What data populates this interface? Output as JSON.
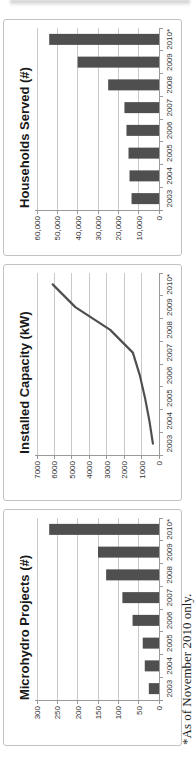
{
  "figure": {
    "footnote": "*As of November 2010 only.",
    "orientation_note": "landscape figure rotated 90 degrees counter-clockwise on page"
  },
  "colors": {
    "bar": "#4f4f4f",
    "line": "#4f4f4f",
    "grid": "#c9c9c9",
    "axis": "#9a9a9a",
    "tick_text": "#333333",
    "title_text": "#191919",
    "panel_border": "#c2c2c2",
    "background": "#ffffff"
  },
  "chart_data": [
    {
      "type": "bar",
      "title": "Microhydro Projects (#)",
      "categories": [
        "2003",
        "2004",
        "2005",
        "2006",
        "2007",
        "2008",
        "2009",
        "2010*"
      ],
      "values": [
        25,
        35,
        40,
        65,
        90,
        130,
        150,
        270
      ],
      "ylim": [
        0,
        300
      ],
      "ytick_step": 50,
      "yticks": [
        "0",
        "50",
        "100",
        "150",
        "200",
        "250",
        "300"
      ],
      "xlabel": "",
      "ylabel": "",
      "grid": true,
      "legend": "none"
    },
    {
      "type": "line",
      "title": "Installed Capacity (kW)",
      "categories": [
        "2003",
        "2004",
        "2005",
        "2006",
        "2007",
        "2008",
        "2009",
        "2010*"
      ],
      "values": [
        350,
        550,
        800,
        1100,
        1500,
        2800,
        4800,
        6100
      ],
      "ylim": [
        0,
        7000
      ],
      "ytick_step": 1000,
      "yticks": [
        "0",
        "1000",
        "2000",
        "3000",
        "4000",
        "5000",
        "6000",
        "7000"
      ],
      "xlabel": "",
      "ylabel": "",
      "grid": true,
      "legend": "none"
    },
    {
      "type": "bar",
      "title": "Households Served (#)",
      "categories": [
        "2003",
        "2004",
        "2005",
        "2006",
        "2007",
        "2008",
        "2009",
        "2010*"
      ],
      "values": [
        13500,
        14500,
        15000,
        16000,
        17000,
        25000,
        40000,
        54000
      ],
      "ylim": [
        0,
        60000
      ],
      "ytick_step": 10000,
      "yticks": [
        "0",
        "10,000",
        "20,000",
        "30,000",
        "40,000",
        "50,000",
        "60,000"
      ],
      "xlabel": "",
      "ylabel": "",
      "grid": true,
      "legend": "none"
    }
  ]
}
